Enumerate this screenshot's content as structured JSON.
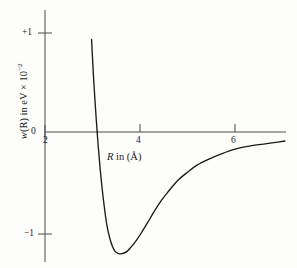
{
  "chart_data": {
    "type": "line",
    "title": "",
    "xlabel": "R in (Å)",
    "ylabel": "w(R) in eV × 10⁻²",
    "xlabel_parts": {
      "symbol": "R",
      "rest": " in (Å)"
    },
    "ylabel_parts": {
      "symbol": "w",
      "rest": "(R) in eV × 10",
      "exponent": "−2"
    },
    "xlim": [
      1.85,
      7.1
    ],
    "ylim": [
      -1.45,
      1.28
    ],
    "xticks": [
      2,
      4,
      6
    ],
    "xtick_labels": [
      "2",
      "4",
      "6"
    ],
    "yticks": [
      1,
      0,
      -1
    ],
    "ytick_labels": [
      "+1",
      "0",
      "−1"
    ],
    "grid": false,
    "legend": null,
    "axis_color": "#3a3a3a",
    "curve_color": "#1a1a1a",
    "background_color": "#fdfdfc",
    "zero_crossing_R": 3.05,
    "minimum": {
      "R": 3.72,
      "w": -1.21
    },
    "asymptote": 0,
    "series": [
      {
        "name": "w(R)",
        "x": [
          2.98,
          3.0,
          3.02,
          3.05,
          3.08,
          3.12,
          3.16,
          3.2,
          3.25,
          3.3,
          3.36,
          3.42,
          3.48,
          3.55,
          3.62,
          3.72,
          3.82,
          3.92,
          4.02,
          4.15,
          4.3,
          4.45,
          4.6,
          4.8,
          5.0,
          5.2,
          5.45,
          5.7,
          6.0,
          6.3,
          6.6,
          6.9,
          7.05
        ],
        "y": [
          0.92,
          0.74,
          0.56,
          0.33,
          0.12,
          -0.14,
          -0.36,
          -0.55,
          -0.75,
          -0.92,
          -1.05,
          -1.14,
          -1.19,
          -1.21,
          -1.21,
          -1.19,
          -1.14,
          -1.08,
          -1.01,
          -0.91,
          -0.79,
          -0.68,
          -0.59,
          -0.48,
          -0.4,
          -0.33,
          -0.27,
          -0.22,
          -0.17,
          -0.14,
          -0.12,
          -0.1,
          -0.09
        ]
      }
    ]
  },
  "axis_geometry": {
    "y_axis_x": 45,
    "x_axis_y": 132,
    "y_axis_top": 10,
    "y_axis_bottom": 262,
    "x_axis_left": 45,
    "x_axis_right": 285
  }
}
